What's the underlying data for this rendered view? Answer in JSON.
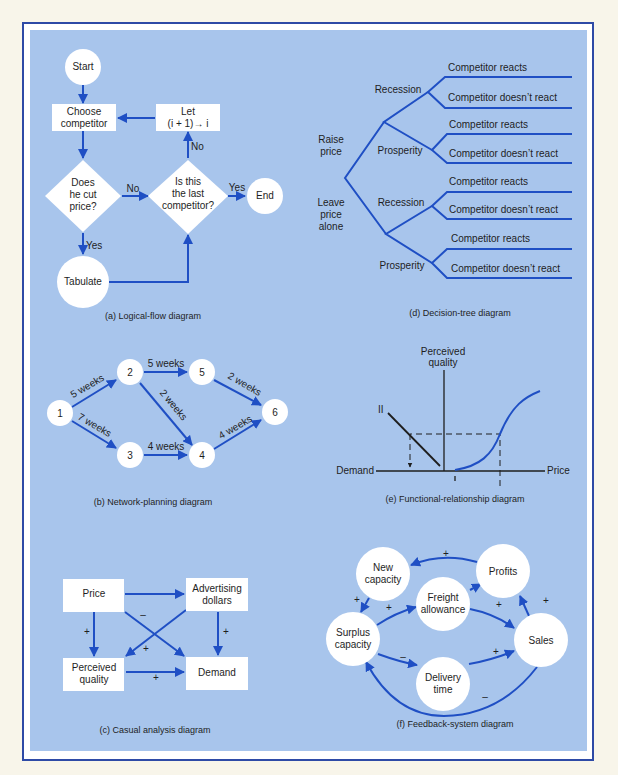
{
  "colors": {
    "page": "#f8f5ea",
    "frame": "#2e4aa6",
    "panel": "#a8c5ec",
    "line": "#1f4fc4",
    "node": "#ffffff",
    "text": "#1e1e1e"
  },
  "logical_flow": {
    "caption": "(a) Logical-flow diagram",
    "start": "Start",
    "choose": [
      "Choose",
      "competitor"
    ],
    "does_cut": [
      "Does",
      "he cut",
      "price?"
    ],
    "is_last": [
      "Is this",
      "the last",
      "competitor?"
    ],
    "let": [
      "Let",
      "(i + 1)→ i"
    ],
    "tabulate": "Tabulate",
    "end": "End",
    "labels": {
      "no1": "No",
      "no2": "No",
      "yes1": "Yes",
      "yes2": "Yes"
    }
  },
  "decision_tree": {
    "caption": "(d) Decision-tree diagram",
    "raise": [
      "Raise",
      "price"
    ],
    "leave": [
      "Leave",
      "price",
      "alone"
    ],
    "states": [
      "Recession",
      "Prosperity",
      "Recession",
      "Prosperity"
    ],
    "outcomes": [
      "Competitor reacts",
      "Competitor doesn’t react",
      "Competitor reacts",
      "Competitor doesn’t react",
      "Competitor reacts",
      "Competitor doesn’t react",
      "Competitor reacts",
      "Competitor doesn’t react"
    ]
  },
  "network": {
    "caption": "(b) Network-planning diagram",
    "nodes": [
      "1",
      "2",
      "3",
      "4",
      "5",
      "6"
    ],
    "edges": {
      "e12": "5 weeks",
      "e13": "7 weeks",
      "e25": "5 weeks",
      "e24": "2 weeks",
      "e34": "4 weeks",
      "e56": "2 weeks",
      "e46": "4 weeks"
    }
  },
  "functional": {
    "caption": "(e) Functional-relationship diagram",
    "y_axis": [
      "Perceived",
      "quality"
    ],
    "x_left": "Demand",
    "x_right": "Price",
    "curve_ii": "II",
    "curve_i": "I"
  },
  "causal": {
    "caption": "(c) Casual analysis diagram",
    "price": "Price",
    "advertising": [
      "Advertising",
      "dollars"
    ],
    "perceived": [
      "Perceived",
      "quality"
    ],
    "demand": "Demand",
    "signs": {
      "price_pq": "+",
      "price_demand": "–",
      "adv_pq": "+",
      "adv_demand": "+",
      "pq_demand": "+"
    }
  },
  "feedback": {
    "caption": "(f) Feedback-system diagram",
    "new_capacity": [
      "New",
      "capacity"
    ],
    "profits": "Profits",
    "freight": [
      "Freight",
      "allowance"
    ],
    "surplus": [
      "Surplus",
      "capacity"
    ],
    "sales": "Sales",
    "delivery": [
      "Delivery",
      "time"
    ],
    "signs": {
      "profits_new": "+",
      "new_surplus": "+",
      "surplus_freight": "+",
      "freight_sales": "+",
      "sales_profits": "+",
      "surplus_delivery": "–",
      "delivery_sales": "+",
      "sales_surplus": "–"
    }
  }
}
